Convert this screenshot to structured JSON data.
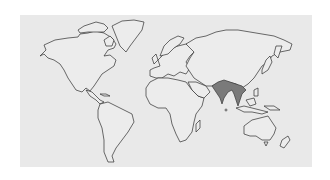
{
  "map": {
    "title": "World map",
    "projection": "world outline",
    "background_color": "#e9e9e9",
    "land_fill": "#ececec",
    "outline_color": "#2e2e2e",
    "highlight_color": "#7a7a7a",
    "highlighted_region": "South and Southeast Asia (India, Bangladesh, Myanmar, Thailand, Indochina)",
    "regions": [
      "North America",
      "Greenland",
      "Central America",
      "South America",
      "Europe",
      "Africa",
      "Middle East",
      "Asia",
      "Southeast Asia",
      "Japan",
      "Indonesia",
      "Australia",
      "New Zealand",
      "Madagascar"
    ]
  }
}
